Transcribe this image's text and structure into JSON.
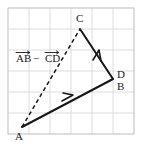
{
  "figure": {
    "width": 141,
    "height": 149,
    "background_color": "#ffffff",
    "grid": {
      "color": "#d4d4d8",
      "frame_color": "#c9c9cf",
      "cell_size": 21,
      "columns": 6,
      "rows": 6,
      "origin_x": 8,
      "origin_y": 8,
      "visible": true
    },
    "stroke_color": "#17171a",
    "expression": {
      "text": "AB − CD",
      "first_term": "AB",
      "operator": "−",
      "second_term": "CD",
      "notation": "vector-overbar-arrow",
      "x": 16,
      "y": 62
    },
    "points": [
      {
        "label": "A",
        "x": 22,
        "y": 127,
        "label_x": 15,
        "label_y": 140
      },
      {
        "label": "C",
        "x": 80,
        "y": 29,
        "label_x": 76,
        "label_y": 22
      },
      {
        "label": "D",
        "x": 113,
        "y": 79,
        "label_x": 117,
        "label_y": 78
      },
      {
        "label": "B",
        "x": 113,
        "y": 79,
        "label_x": 117,
        "label_y": 90
      }
    ],
    "vectors": [
      {
        "name": "AB",
        "from": "A",
        "to": "B",
        "style": "solid",
        "arrow": "mid",
        "x1": 22,
        "y1": 127,
        "x2": 113,
        "y2": 79
      },
      {
        "name": "DC",
        "from": "D",
        "to": "C",
        "style": "solid",
        "arrow": "mid",
        "x1": 113,
        "y1": 79,
        "x2": 80,
        "y2": 29
      },
      {
        "name": "AC",
        "from": "A",
        "to": "C",
        "style": "dashed",
        "arrow": "none",
        "x1": 22,
        "y1": 127,
        "x2": 80,
        "y2": 29
      }
    ]
  }
}
